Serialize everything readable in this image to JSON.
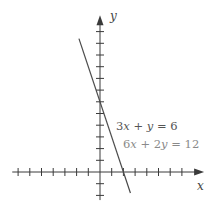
{
  "chart_data": {
    "type": "line",
    "title": "",
    "xlabel": "x",
    "ylabel": "y",
    "xlim": [
      -7.5,
      8.9
    ],
    "ylim": [
      -2.4,
      13.4
    ],
    "grid": false,
    "x_ticks": [
      -7,
      -6,
      -5,
      -4,
      -3,
      -2,
      -1,
      1,
      2,
      3,
      4,
      5,
      6,
      7
    ],
    "y_ticks": [
      -2,
      -1,
      1,
      2,
      3,
      4,
      5,
      6,
      7,
      8,
      9,
      10,
      11,
      12
    ],
    "tick_labels_shown": false,
    "series": [
      {
        "name": "3x + y = 6",
        "equivalent": "6x + 2y = 12",
        "slope": -3,
        "intercept": 6,
        "x": [
          -1.8,
          2.6
        ],
        "y": [
          11.4,
          -1.8
        ],
        "x_intercept": 2,
        "y_intercept": 6
      }
    ],
    "annotations": [
      {
        "text": "3x + y = 6",
        "x": 1.4,
        "y": 4.0
      },
      {
        "text": "6x + 2y = 12",
        "x": 2.0,
        "y": 2.5
      }
    ]
  },
  "labels": {
    "x_axis": "x",
    "y_axis": "y",
    "equation_1": "3x + y = 6",
    "equation_2": "6x + 2y = 12"
  },
  "colors": {
    "axis": "#3a3a3a",
    "line": "#4a4a4a",
    "equation_1": "#555555",
    "equation_2": "#8a8a8a"
  }
}
